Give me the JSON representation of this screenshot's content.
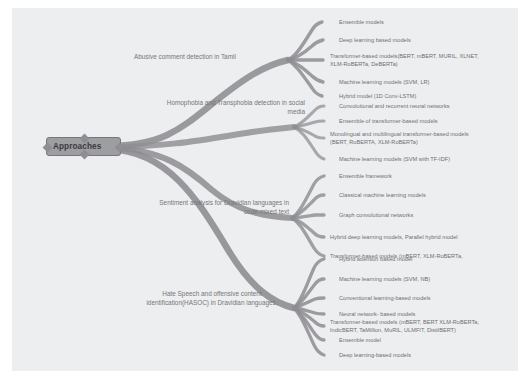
{
  "diagram": {
    "type": "mind-map",
    "title_node": "Approaches",
    "background_color": "#edeef0",
    "branch_color": "#8d8d92",
    "text_color": "#6e6e72",
    "root_fill": "#9d9da2"
  },
  "root": {
    "label": "Approaches"
  },
  "branches": [
    {
      "id": "abusive",
      "label": "Abusive comment detection in Tamil",
      "leaves": [
        "Ensemble models",
        "Deep learning based models",
        "Transformer-based models(BERT, mBERT, MURIL, XLNET,\nXLM-RoBERTa, DeBERTa)",
        "Machine learning models (SVM, LR)",
        "Hybrid model (1D Conv-LSTM)"
      ]
    },
    {
      "id": "homophobia",
      "label": "Homophobia and Transphobia detection in social\nmedia",
      "leaves": [
        "Convolutional and recurrent neural networks",
        "Ensemble of transformer-based models",
        "Monolingual and multilingual transformer-based models\n(BERT, RoBERTA, XLM-RoBERTa)",
        "Machine learning models (SVM with TF-IDF)"
      ]
    },
    {
      "id": "sentiment",
      "label": "Sentiment analysis for Dravidian languages in\ncode-mixed text",
      "leaves": [
        "Ensemble framework",
        "Classical machine learning models",
        "Graph convolutional networks",
        "Hybrid deep learning models, Parallel hybrid model",
        "Transformer-based models (mBERT, XLM-RoBERTa,"
      ]
    },
    {
      "id": "hasoc",
      "label": "Hate Speech and offensive content\nidentification(HASOC) in Dravidian languages.",
      "leaves": [
        "Hybrid attention based model",
        "Machine learning models (SVM, NB)",
        "Conventional learning-based models",
        "Neural network- based models",
        "Transformer-based models (mBERT, BERT XLM-RoBERTa,\nIndicBERT, TaMillion, MuRIL, ULMFIT, DistilBERT)",
        "Ensemble model",
        "Deep learning-based models"
      ]
    }
  ]
}
